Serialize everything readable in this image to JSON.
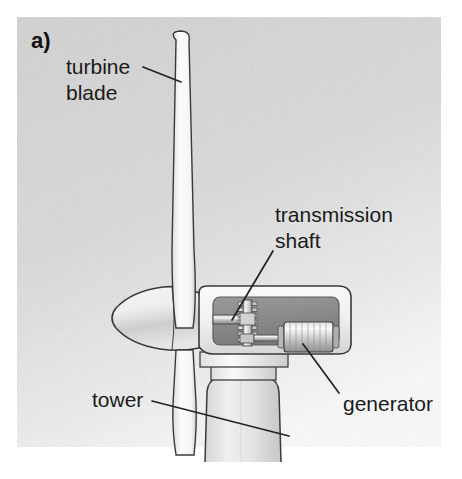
{
  "figure": {
    "panel_label": "a)",
    "background_color": "#d9d9d9",
    "ink_color": "#222222",
    "labels": {
      "turbine_blade_line1": "turbine",
      "turbine_blade_line2": "blade",
      "transmission_line1": "transmission",
      "transmission_line2": "shaft",
      "tower": "tower",
      "generator": "generator"
    },
    "parts": {
      "blade": "turbine blade",
      "hub": "rotor hub nose cone",
      "nacelle": "nacelle housing",
      "cutaway_window": "cutaway interior window",
      "transmission_shaft": "transmission shaft",
      "gear": "gear wheel",
      "generator": "generator cylinder",
      "yaw_flange": "yaw flange plates",
      "tower": "tower"
    },
    "colors": {
      "nacelle_fill": "#f2f2f2",
      "interior_fill": "#8e8e8e",
      "metal_light": "#e8e8e8",
      "metal_mid": "#b5b5b5",
      "metal_dark": "#6f6f6f",
      "tower_fill": "#e3e3e3",
      "blade_fill": "#fbfbfb"
    }
  }
}
